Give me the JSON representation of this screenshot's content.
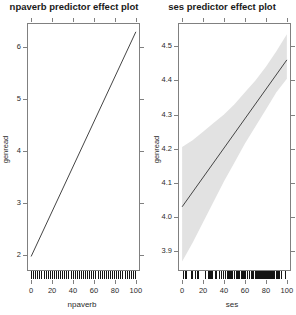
{
  "figure": {
    "background": "#ffffff",
    "line_color": "#454545",
    "band_color": "#e2e2e2",
    "axis_color": "#808080",
    "rug_color": "#151515"
  },
  "chart_data": [
    {
      "type": "line",
      "title": "npaverb predictor effect plot",
      "xlabel": "npaverb",
      "ylabel": "genread",
      "xlim": [
        -3,
        103
      ],
      "ylim": [
        1.72,
        6.45
      ],
      "xticks": [
        0,
        20,
        40,
        60,
        80,
        100
      ],
      "xtick_labels": [
        "0",
        "20",
        "40",
        "60",
        "80",
        "100"
      ],
      "yticks": [
        2,
        3,
        4,
        5,
        6
      ],
      "ytick_labels": [
        "2",
        "3",
        "4",
        "5",
        "6"
      ],
      "grid": false,
      "legend": null,
      "series": [
        {
          "name": "fit",
          "x": [
            0,
            100
          ],
          "y": [
            1.98,
            6.3
          ]
        }
      ],
      "confidence_band": {
        "visible": false,
        "x": [
          0,
          100
        ],
        "lower": [
          1.95,
          6.24
        ],
        "upper": [
          2.01,
          6.36
        ]
      },
      "rug": {
        "position": "bottom",
        "values": [
          0,
          2,
          4,
          6,
          8,
          10,
          12,
          14,
          16,
          18,
          20,
          22,
          24,
          26,
          28,
          30,
          32,
          34,
          36,
          38,
          40,
          42,
          44,
          46,
          48,
          50,
          52,
          54,
          56,
          58,
          60,
          62,
          64,
          66,
          68,
          70,
          72,
          74,
          76,
          78,
          80,
          82,
          84,
          86,
          88,
          90,
          92,
          94,
          96,
          98,
          100
        ]
      }
    },
    {
      "type": "line",
      "title": "ses predictor effect plot",
      "xlabel": "ses",
      "ylabel": "genread",
      "xlim": [
        -3,
        103
      ],
      "ylim": [
        3.845,
        4.565
      ],
      "xticks": [
        0,
        20,
        40,
        60,
        80,
        100
      ],
      "xtick_labels": [
        "0",
        "20",
        "40",
        "60",
        "80",
        "100"
      ],
      "yticks": [
        3.9,
        4.0,
        4.1,
        4.2,
        4.3,
        4.4,
        4.5
      ],
      "ytick_labels": [
        "3.9",
        "4.0",
        "4.1",
        "4.2",
        "4.3",
        "4.4",
        "4.5"
      ],
      "grid": false,
      "legend": null,
      "series": [
        {
          "name": "fit",
          "x": [
            0,
            100
          ],
          "y": [
            4.03,
            4.46
          ]
        }
      ],
      "confidence_band": {
        "visible": true,
        "x": [
          0,
          10,
          20,
          30,
          40,
          50,
          60,
          70,
          80,
          90,
          100
        ],
        "lower": [
          3.87,
          3.925,
          3.985,
          4.045,
          4.105,
          4.16,
          4.215,
          4.265,
          4.315,
          4.365,
          4.405
        ],
        "upper": [
          4.205,
          4.225,
          4.25,
          4.275,
          4.3,
          4.33,
          4.365,
          4.4,
          4.44,
          4.485,
          4.535
        ]
      },
      "rug": {
        "position": "bottom",
        "values": [
          1,
          3,
          4,
          9,
          10,
          12,
          14,
          15,
          22,
          25,
          26,
          27,
          28,
          29,
          32,
          33,
          36,
          37,
          39,
          41,
          43,
          44,
          45,
          46,
          47,
          48,
          50,
          52,
          53,
          54,
          55,
          57,
          58,
          59,
          60,
          61,
          63,
          64,
          66,
          67,
          68,
          70,
          71,
          72,
          73,
          74,
          75,
          76,
          77,
          78,
          79,
          80,
          81,
          82,
          83,
          84,
          85,
          86,
          87,
          88,
          89,
          90,
          91,
          92,
          93,
          95,
          99
        ]
      }
    }
  ]
}
